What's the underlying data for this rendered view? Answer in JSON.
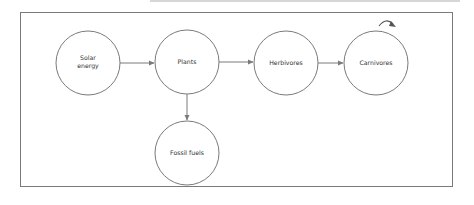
{
  "diagram": {
    "type": "energy-flow",
    "nodes": [
      {
        "id": "solar",
        "label_lines": [
          "Solar",
          "energy"
        ],
        "cx": 88,
        "cy": 63
      },
      {
        "id": "plants",
        "label_lines": [
          "Plants"
        ],
        "cx": 187,
        "cy": 62
      },
      {
        "id": "herbivores",
        "label_lines": [
          "Herbivores"
        ],
        "cx": 286,
        "cy": 63
      },
      {
        "id": "carnivores",
        "label_lines": [
          "Carnivores"
        ],
        "cx": 376,
        "cy": 63
      },
      {
        "id": "fossil",
        "label_lines": [
          "Fossil fuels"
        ],
        "cx": 187,
        "cy": 153
      }
    ],
    "edges": [
      {
        "from": "solar",
        "to": "plants"
      },
      {
        "from": "plants",
        "to": "herbivores"
      },
      {
        "from": "herbivores",
        "to": "carnivores"
      },
      {
        "from": "plants",
        "to": "fossil"
      }
    ],
    "annotations": [
      {
        "type": "curved-arrow",
        "near": "carnivores"
      }
    ],
    "colors": {
      "stroke": "#7a7a7a",
      "text": "#333333",
      "background": "#ffffff"
    }
  }
}
